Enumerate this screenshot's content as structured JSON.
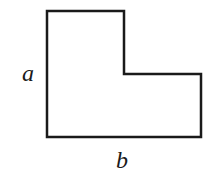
{
  "diagram": {
    "type": "L-shaped polygon",
    "stroke_color": "#1a1a1a",
    "fill_color": "#ffffff",
    "vertices": [
      [
        47,
        11
      ],
      [
        124,
        11
      ],
      [
        124,
        74
      ],
      [
        201,
        74
      ],
      [
        201,
        137
      ],
      [
        47,
        137
      ]
    ],
    "labels": {
      "left": "a",
      "bottom": "b"
    }
  }
}
